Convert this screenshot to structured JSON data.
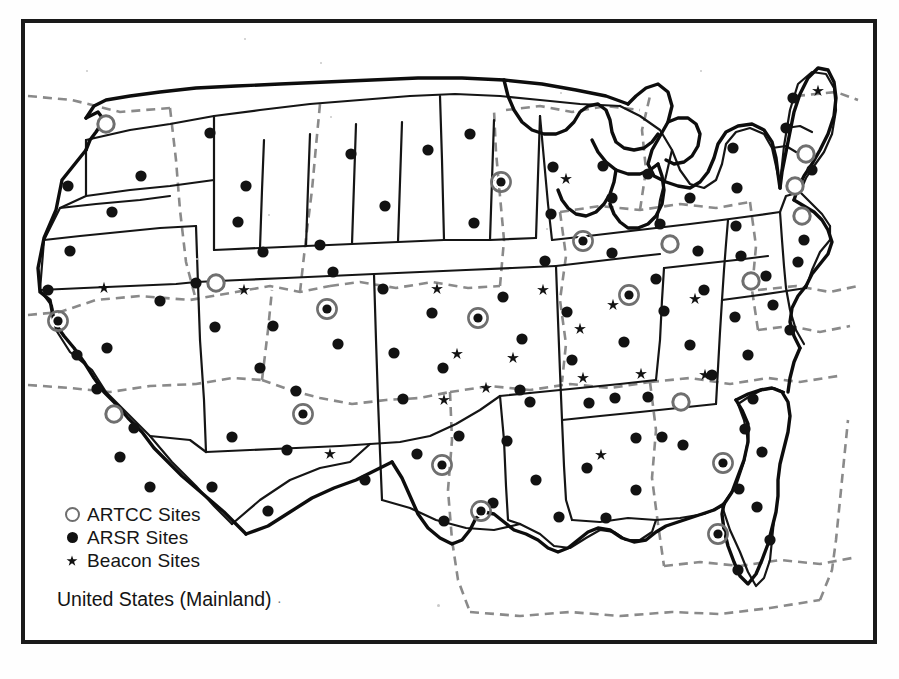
{
  "figure": {
    "caption": "United States (Mainland)",
    "caption_trailing_mark": "·",
    "frame_color": "#1a1a1a",
    "background_color": "#ffffff"
  },
  "legend": {
    "items": [
      {
        "symbol": "open-circle",
        "icon_name": "artcc-open-circle-icon",
        "label": "ARTCC Sites",
        "color": "#6e6e6e"
      },
      {
        "symbol": "filled-dot",
        "icon_name": "arsr-filled-dot-icon",
        "label": "ARSR Sites",
        "color": "#111111"
      },
      {
        "symbol": "star",
        "icon_name": "beacon-star-icon",
        "label": "Beacon Sites",
        "glyph": "✳",
        "color": "#111111"
      }
    ]
  },
  "map_data": {
    "type": "point-map",
    "region": "United States (Mainland)",
    "marker_types": {
      "artcc_open": "ARTCC site drawn as hollow gray ring",
      "artcc_ringed": "ARTCC co-located with ARSR: black dot inside gray ring",
      "arsr": "ARSR radar site, solid black dot",
      "beacon": "Beacon-only site, small black star"
    },
    "artcc_open": [
      {
        "x": 106,
        "y": 124
      },
      {
        "x": 216,
        "y": 283
      },
      {
        "x": 114,
        "y": 414
      },
      {
        "x": 670,
        "y": 244
      },
      {
        "x": 751,
        "y": 281
      },
      {
        "x": 681,
        "y": 402
      },
      {
        "x": 806,
        "y": 154
      },
      {
        "x": 802,
        "y": 216
      },
      {
        "x": 795,
        "y": 186
      }
    ],
    "artcc_ringed": [
      {
        "x": 58,
        "y": 321
      },
      {
        "x": 327,
        "y": 309
      },
      {
        "x": 303,
        "y": 414
      },
      {
        "x": 442,
        "y": 465
      },
      {
        "x": 481,
        "y": 511
      },
      {
        "x": 478,
        "y": 318
      },
      {
        "x": 501,
        "y": 182
      },
      {
        "x": 583,
        "y": 241
      },
      {
        "x": 629,
        "y": 295
      },
      {
        "x": 723,
        "y": 463
      },
      {
        "x": 718,
        "y": 534
      }
    ],
    "arsr": [
      {
        "x": 68,
        "y": 186
      },
      {
        "x": 70,
        "y": 251
      },
      {
        "x": 48,
        "y": 290
      },
      {
        "x": 77,
        "y": 355
      },
      {
        "x": 97,
        "y": 389
      },
      {
        "x": 134,
        "y": 428
      },
      {
        "x": 120,
        "y": 457
      },
      {
        "x": 150,
        "y": 487
      },
      {
        "x": 107,
        "y": 348
      },
      {
        "x": 141,
        "y": 176
      },
      {
        "x": 112,
        "y": 212
      },
      {
        "x": 210,
        "y": 133
      },
      {
        "x": 160,
        "y": 301
      },
      {
        "x": 196,
        "y": 283
      },
      {
        "x": 215,
        "y": 327
      },
      {
        "x": 238,
        "y": 222
      },
      {
        "x": 263,
        "y": 252
      },
      {
        "x": 246,
        "y": 186
      },
      {
        "x": 273,
        "y": 326
      },
      {
        "x": 260,
        "y": 368
      },
      {
        "x": 296,
        "y": 391
      },
      {
        "x": 232,
        "y": 437
      },
      {
        "x": 287,
        "y": 450
      },
      {
        "x": 212,
        "y": 487
      },
      {
        "x": 268,
        "y": 511
      },
      {
        "x": 320,
        "y": 245
      },
      {
        "x": 351,
        "y": 154
      },
      {
        "x": 333,
        "y": 272
      },
      {
        "x": 338,
        "y": 344
      },
      {
        "x": 385,
        "y": 206
      },
      {
        "x": 383,
        "y": 289
      },
      {
        "x": 394,
        "y": 353
      },
      {
        "x": 403,
        "y": 399
      },
      {
        "x": 428,
        "y": 150
      },
      {
        "x": 432,
        "y": 313
      },
      {
        "x": 443,
        "y": 368
      },
      {
        "x": 459,
        "y": 436
      },
      {
        "x": 444,
        "y": 521
      },
      {
        "x": 493,
        "y": 503
      },
      {
        "x": 417,
        "y": 454
      },
      {
        "x": 365,
        "y": 480
      },
      {
        "x": 470,
        "y": 134
      },
      {
        "x": 474,
        "y": 223
      },
      {
        "x": 503,
        "y": 297
      },
      {
        "x": 522,
        "y": 339
      },
      {
        "x": 530,
        "y": 402
      },
      {
        "x": 507,
        "y": 441
      },
      {
        "x": 536,
        "y": 480
      },
      {
        "x": 553,
        "y": 167
      },
      {
        "x": 551,
        "y": 214
      },
      {
        "x": 545,
        "y": 261
      },
      {
        "x": 567,
        "y": 312
      },
      {
        "x": 572,
        "y": 360
      },
      {
        "x": 589,
        "y": 403
      },
      {
        "x": 587,
        "y": 468
      },
      {
        "x": 603,
        "y": 166
      },
      {
        "x": 612,
        "y": 198
      },
      {
        "x": 612,
        "y": 253
      },
      {
        "x": 624,
        "y": 342
      },
      {
        "x": 636,
        "y": 490
      },
      {
        "x": 606,
        "y": 518
      },
      {
        "x": 648,
        "y": 174
      },
      {
        "x": 660,
        "y": 224
      },
      {
        "x": 656,
        "y": 279
      },
      {
        "x": 664,
        "y": 311
      },
      {
        "x": 648,
        "y": 397
      },
      {
        "x": 690,
        "y": 198
      },
      {
        "x": 698,
        "y": 251
      },
      {
        "x": 704,
        "y": 290
      },
      {
        "x": 690,
        "y": 345
      },
      {
        "x": 683,
        "y": 445
      },
      {
        "x": 712,
        "y": 375
      },
      {
        "x": 733,
        "y": 148
      },
      {
        "x": 737,
        "y": 188
      },
      {
        "x": 736,
        "y": 226
      },
      {
        "x": 741,
        "y": 256
      },
      {
        "x": 735,
        "y": 317
      },
      {
        "x": 748,
        "y": 355
      },
      {
        "x": 753,
        "y": 399
      },
      {
        "x": 745,
        "y": 429
      },
      {
        "x": 766,
        "y": 276
      },
      {
        "x": 773,
        "y": 305
      },
      {
        "x": 762,
        "y": 452
      },
      {
        "x": 739,
        "y": 489
      },
      {
        "x": 757,
        "y": 507
      },
      {
        "x": 770,
        "y": 540
      },
      {
        "x": 738,
        "y": 570
      },
      {
        "x": 786,
        "y": 128
      },
      {
        "x": 793,
        "y": 98
      },
      {
        "x": 812,
        "y": 170
      },
      {
        "x": 804,
        "y": 240
      },
      {
        "x": 798,
        "y": 262
      },
      {
        "x": 790,
        "y": 330
      },
      {
        "x": 636,
        "y": 438
      },
      {
        "x": 662,
        "y": 437
      },
      {
        "x": 615,
        "y": 398
      },
      {
        "x": 559,
        "y": 517
      },
      {
        "x": 520,
        "y": 390
      }
    ],
    "beacon": [
      {
        "x": 104,
        "y": 288
      },
      {
        "x": 244,
        "y": 290
      },
      {
        "x": 330,
        "y": 454
      },
      {
        "x": 437,
        "y": 289
      },
      {
        "x": 457,
        "y": 354
      },
      {
        "x": 486,
        "y": 388
      },
      {
        "x": 513,
        "y": 358
      },
      {
        "x": 500,
        "y": 182
      },
      {
        "x": 543,
        "y": 290
      },
      {
        "x": 566,
        "y": 179
      },
      {
        "x": 583,
        "y": 378
      },
      {
        "x": 580,
        "y": 329
      },
      {
        "x": 613,
        "y": 305
      },
      {
        "x": 641,
        "y": 374
      },
      {
        "x": 695,
        "y": 299
      },
      {
        "x": 705,
        "y": 375
      },
      {
        "x": 818,
        "y": 91
      },
      {
        "x": 601,
        "y": 455
      },
      {
        "x": 444,
        "y": 400
      }
    ]
  }
}
